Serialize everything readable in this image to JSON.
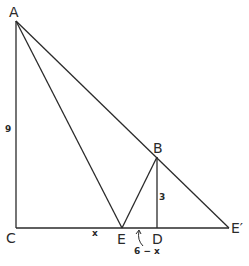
{
  "diagram": {
    "points": {
      "A": {
        "label": "A",
        "x": 16,
        "y": 21
      },
      "B": {
        "label": "B",
        "x": 157,
        "y": 157
      },
      "C": {
        "label": "C",
        "x": 16,
        "y": 228
      },
      "D": {
        "label": "D",
        "x": 157,
        "y": 228
      },
      "E": {
        "label": "E",
        "x": 122,
        "y": 228
      },
      "E_prime": {
        "label": "E′",
        "x": 229,
        "y": 228
      }
    },
    "segments": [
      [
        "A",
        "C"
      ],
      [
        "C",
        "E_prime"
      ],
      [
        "A",
        "E"
      ],
      [
        "A",
        "E_prime"
      ],
      [
        "E",
        "B"
      ],
      [
        "B",
        "D"
      ]
    ],
    "lengths": {
      "AC": "9",
      "BD": "3",
      "CE": "x",
      "ED": "6 − x"
    }
  }
}
